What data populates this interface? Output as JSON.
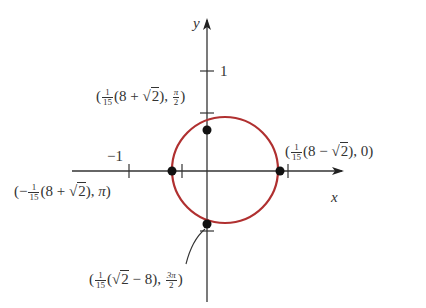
{
  "figure": {
    "axis_labels": {
      "x": "x",
      "y": "y"
    },
    "ticks": {
      "y_one": "1",
      "x_neg_one": "−1"
    },
    "curve_color": "#b03030",
    "points": [
      {
        "name": "top",
        "label_prefix": "(",
        "frac_n": "1",
        "frac_d": "15",
        "expr_a": "(8 + ",
        "root": "2",
        "expr_b": "), ",
        "angle_n": "π",
        "angle_d": "2",
        "suffix": ")"
      },
      {
        "name": "right",
        "label_prefix": "(",
        "frac_n": "1",
        "frac_d": "15",
        "expr_a": "(8 − ",
        "root": "2",
        "expr_b": "), 0)"
      },
      {
        "name": "left",
        "label_prefix": "(−",
        "frac_n": "1",
        "frac_d": "15",
        "expr_a": "(8 + ",
        "root": "2",
        "expr_b": "), ",
        "angle": "π",
        "suffix": ")"
      },
      {
        "name": "bottom",
        "label_prefix": "(",
        "frac_n": "1",
        "frac_d": "15",
        "expr_a": "(",
        "root": "2",
        "expr_b": " − 8), ",
        "angle_n": "3π",
        "angle_d": "2",
        "suffix": ")"
      }
    ]
  }
}
